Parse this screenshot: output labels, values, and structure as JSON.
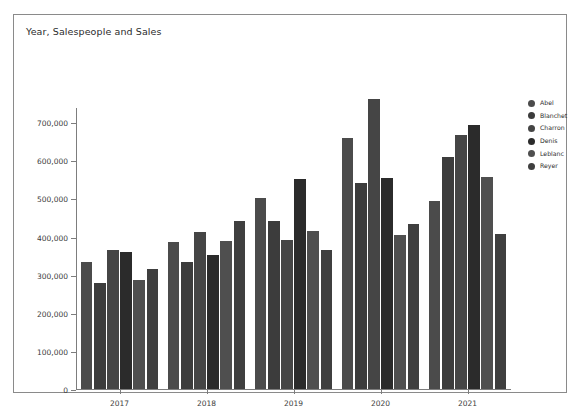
{
  "card": {
    "title": "Year, Salespeople and Sales",
    "border_color": "#8a8a8a",
    "background": "#ffffff"
  },
  "legend": {
    "position": "right",
    "entries": [
      {
        "label": "Abel",
        "color": "#4b4b4b"
      },
      {
        "label": "Blanchet",
        "color": "#3c3c3c"
      },
      {
        "label": "Charron",
        "color": "#454545"
      },
      {
        "label": "Denis",
        "color": "#2b2b2b"
      },
      {
        "label": "Leblanc",
        "color": "#4f4f4f"
      },
      {
        "label": "Reyer",
        "color": "#3f3f3f"
      }
    ]
  },
  "chart_data": {
    "type": "bar",
    "title": "Year, Salespeople and Sales",
    "xlabel": "",
    "ylabel": "",
    "categories": [
      "2017",
      "2018",
      "2019",
      "2020",
      "2021"
    ],
    "ylim": [
      0,
      740000
    ],
    "yticks": [
      0,
      100000,
      200000,
      300000,
      400000,
      500000,
      600000,
      700000
    ],
    "ytick_labels": [
      "0",
      "100,000",
      "200,000",
      "300,000",
      "400,000",
      "500,000",
      "600,000",
      "700,000"
    ],
    "grid": false,
    "legend_position": "right",
    "series": [
      {
        "name": "Abel",
        "color": "#4b4b4b",
        "values": [
          332000,
          386000,
          500000,
          659000,
          494000
        ]
      },
      {
        "name": "Blanchet",
        "color": "#3c3c3c",
        "values": [
          278000,
          333000,
          441000,
          540000,
          610000
        ]
      },
      {
        "name": "Charron",
        "color": "#454545",
        "values": [
          366000,
          412000,
          391000,
          761000,
          667000
        ]
      },
      {
        "name": "Denis",
        "color": "#2b2b2b",
        "values": [
          360000,
          352000,
          552000,
          554000,
          692000
        ]
      },
      {
        "name": "Leblanc",
        "color": "#4f4f4f",
        "values": [
          287000,
          389000,
          414000,
          404000,
          556000
        ]
      },
      {
        "name": "Reyer",
        "color": "#3f3f3f",
        "values": [
          315000,
          441000,
          364000,
          432000,
          408000
        ]
      }
    ]
  }
}
